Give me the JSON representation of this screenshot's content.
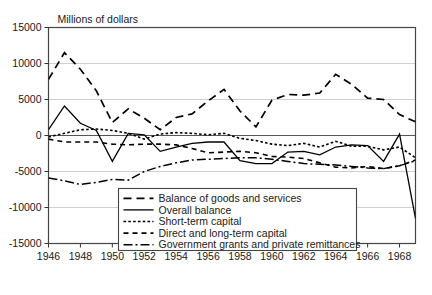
{
  "chart_data": {
    "type": "line",
    "title": "Millions of dollars",
    "xlabel": "",
    "ylabel": "",
    "xlim": [
      1946,
      1969
    ],
    "ylim": [
      -15000,
      15000
    ],
    "grid": true,
    "legend_position": "bottom-center-inset",
    "ytick_labels": [
      "15000",
      "10000",
      "5000",
      "0",
      "-5000",
      "-10000",
      "-15000"
    ],
    "ytick_values": [
      15000,
      10000,
      5000,
      0,
      -5000,
      -10000,
      -15000
    ],
    "xtick_labels": [
      "1946",
      "1948",
      "1950",
      "1952",
      "1954",
      "1956",
      "1958",
      "1960",
      "1962",
      "1964",
      "1966",
      "1968"
    ],
    "xtick_values": [
      1946,
      1948,
      1950,
      1952,
      1954,
      1956,
      1958,
      1960,
      1962,
      1964,
      1966,
      1968
    ],
    "x": [
      1946,
      1947,
      1948,
      1949,
      1950,
      1951,
      1952,
      1953,
      1954,
      1955,
      1956,
      1957,
      1958,
      1959,
      1960,
      1961,
      1962,
      1963,
      1964,
      1965,
      1966,
      1967,
      1968,
      1969
    ],
    "series": [
      {
        "name": "Balance of goods and services",
        "dash": "8,5",
        "width": 1.7,
        "values": [
          7800,
          11500,
          9200,
          6200,
          1800,
          3700,
          2400,
          800,
          2500,
          3000,
          4800,
          6400,
          3400,
          1200,
          4900,
          5700,
          5600,
          5900,
          8500,
          7100,
          5200,
          5000,
          2900,
          1900
        ]
      },
      {
        "name": "Overall balance",
        "dash": "none",
        "width": 1.3,
        "values": [
          800,
          4100,
          1700,
          700,
          -3600,
          300,
          100,
          -2200,
          -1600,
          -1100,
          -900,
          -900,
          -3500,
          -3900,
          -3900,
          -2300,
          -2200,
          -2700,
          -1600,
          -1300,
          -1400,
          -3600,
          200,
          -11500
        ]
      },
      {
        "name": "Short-term capital",
        "dash": "2.6,2.2",
        "width": 1.6,
        "values": [
          -200,
          300,
          800,
          900,
          700,
          300,
          -500,
          200,
          400,
          300,
          100,
          300,
          -400,
          -700,
          -1200,
          -1400,
          -1100,
          -1600,
          -800,
          -1500,
          -1500,
          -2000,
          -1600,
          -3100
        ]
      },
      {
        "name": "Direct and long-term capital",
        "dash": "5,4",
        "width": 1.6,
        "values": [
          -500,
          -900,
          -900,
          -900,
          -1200,
          -1300,
          -1200,
          -1200,
          -1300,
          -1800,
          -2400,
          -2300,
          -2200,
          -2400,
          -2900,
          -3000,
          -3200,
          -3800,
          -4400,
          -4500,
          -4300,
          -4600,
          -4200,
          -3400
        ]
      },
      {
        "name": "Government grants and private remittances",
        "dash": "9,3,2,3",
        "width": 1.5,
        "values": [
          -5900,
          -6300,
          -6800,
          -6500,
          -6100,
          -6200,
          -5000,
          -4300,
          -3800,
          -3400,
          -3300,
          -3200,
          -3100,
          -3100,
          -3300,
          -3600,
          -3900,
          -4000,
          -4100,
          -4300,
          -4500,
          -4600,
          -4200,
          -3500
        ]
      }
    ]
  },
  "legend": {
    "items": [
      {
        "label": "Balance of goods and services"
      },
      {
        "label": "Overall balance"
      },
      {
        "label": "Short-term capital"
      },
      {
        "label": "Direct and long-term capital"
      },
      {
        "label": "Government grants and private remittances"
      }
    ]
  }
}
